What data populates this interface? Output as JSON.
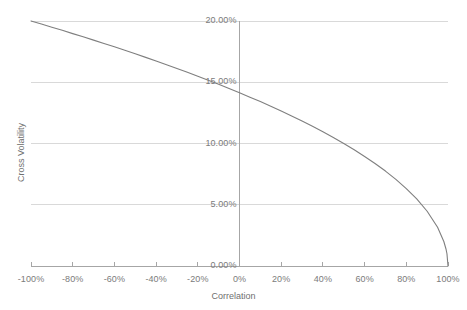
{
  "chart_data": {
    "type": "line",
    "title": "",
    "xlabel": "Correlation",
    "ylabel": "Cross Volatility",
    "xlim": [
      -100,
      100
    ],
    "ylim": [
      0,
      20
    ],
    "grid": true,
    "legend": "none",
    "x_tick_labels": [
      "-100%",
      "-80%",
      "-60%",
      "-40%",
      "-20%",
      "0%",
      "20%",
      "40%",
      "60%",
      "80%",
      "100%"
    ],
    "x_tick_values": [
      -100,
      -80,
      -60,
      -40,
      -20,
      0,
      20,
      40,
      60,
      80,
      100
    ],
    "y_tick_labels": [
      "0.00%",
      "5.00%",
      "10.00%",
      "15.00%",
      "20.00%"
    ],
    "y_tick_values": [
      0,
      5,
      10,
      15,
      20
    ],
    "series": [
      {
        "name": "Cross Volatility",
        "color": "#7f7f7f",
        "x": [
          -100,
          -95,
          -90,
          -85,
          -80,
          -75,
          -70,
          -65,
          -60,
          -55,
          -50,
          -45,
          -40,
          -35,
          -30,
          -25,
          -20,
          -15,
          -10,
          -5,
          0,
          5,
          10,
          15,
          20,
          25,
          30,
          35,
          40,
          45,
          50,
          55,
          60,
          65,
          70,
          75,
          80,
          85,
          90,
          95,
          98,
          99,
          99.5,
          100
        ],
        "y": [
          20.0,
          19.75,
          19.49,
          19.24,
          18.97,
          18.71,
          18.44,
          18.17,
          17.89,
          17.61,
          17.32,
          17.03,
          16.73,
          16.43,
          16.12,
          15.81,
          15.49,
          15.17,
          14.83,
          14.49,
          14.14,
          13.78,
          13.42,
          13.04,
          12.65,
          12.25,
          11.83,
          11.4,
          10.95,
          10.49,
          10.0,
          9.49,
          8.94,
          8.37,
          7.75,
          7.07,
          6.32,
          5.48,
          4.47,
          3.16,
          2.0,
          1.41,
          1.0,
          0.0
        ]
      }
    ],
    "formula_note": "cross volatility = 10% * sqrt(2 * (1 - correlation))"
  },
  "axes": {
    "x_title": "Correlation",
    "y_title": "Cross Volatility"
  },
  "style": {
    "line_color": "#7f7f7f",
    "gridline_color": "#d9d9d9",
    "axis_color": "#a6a6a6",
    "text_color": "#7b7b7b",
    "background": "#ffffff"
  }
}
